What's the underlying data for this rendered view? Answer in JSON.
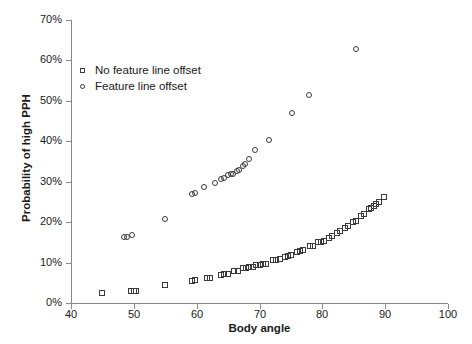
{
  "chart_data": {
    "type": "scatter",
    "title": "",
    "xlabel": "Body angle",
    "ylabel": "Probability of high PPH",
    "xlim": [
      40,
      100
    ],
    "ylim": [
      0,
      0.7
    ],
    "xticks": [
      "40",
      "50",
      "60",
      "70",
      "80",
      "90",
      "100"
    ],
    "xtick_values": [
      40,
      50,
      60,
      70,
      80,
      90,
      100
    ],
    "yticks": [
      "0%",
      "10%",
      "20%",
      "30%",
      "40%",
      "50%",
      "60%",
      "70%"
    ],
    "ytick_values": [
      0,
      10,
      20,
      30,
      40,
      50,
      60,
      70
    ],
    "grid": false,
    "legend_position": "upper-left-inside",
    "series": [
      {
        "name": "No feature line offset",
        "marker": "square",
        "color": "#3b3b3b",
        "points": [
          [
            45.0,
            2.5
          ],
          [
            49.6,
            3.0
          ],
          [
            50.0,
            3.0
          ],
          [
            50.4,
            3.0
          ],
          [
            55.0,
            4.5
          ],
          [
            59.2,
            5.5
          ],
          [
            59.8,
            5.6
          ],
          [
            61.6,
            6.2
          ],
          [
            62.2,
            6.3
          ],
          [
            63.8,
            7.0
          ],
          [
            64.4,
            7.1
          ],
          [
            65.0,
            7.2
          ],
          [
            66.0,
            7.8
          ],
          [
            66.6,
            7.9
          ],
          [
            67.4,
            8.6
          ],
          [
            67.9,
            8.7
          ],
          [
            68.4,
            8.8
          ],
          [
            68.9,
            8.9
          ],
          [
            69.5,
            9.4
          ],
          [
            70.0,
            9.5
          ],
          [
            70.5,
            9.6
          ],
          [
            71.0,
            9.7
          ],
          [
            72.2,
            10.6
          ],
          [
            72.7,
            10.7
          ],
          [
            73.2,
            10.8
          ],
          [
            74.0,
            11.4
          ],
          [
            74.5,
            11.6
          ],
          [
            75.0,
            11.8
          ],
          [
            76.0,
            12.6
          ],
          [
            76.5,
            12.8
          ],
          [
            77.0,
            13.0
          ],
          [
            78.0,
            14.0
          ],
          [
            78.5,
            14.2
          ],
          [
            79.3,
            15.0
          ],
          [
            79.8,
            15.2
          ],
          [
            80.3,
            15.4
          ],
          [
            81.0,
            16.2
          ],
          [
            81.5,
            16.5
          ],
          [
            82.3,
            17.4
          ],
          [
            82.8,
            17.7
          ],
          [
            83.6,
            18.6
          ],
          [
            84.1,
            19.0
          ],
          [
            84.9,
            20.0
          ],
          [
            85.4,
            20.4
          ],
          [
            86.2,
            21.6
          ],
          [
            86.7,
            22.0
          ],
          [
            87.4,
            23.2
          ],
          [
            87.8,
            23.6
          ],
          [
            88.2,
            24.0
          ],
          [
            88.6,
            24.6
          ],
          [
            89.0,
            25.0
          ],
          [
            89.8,
            26.2
          ]
        ]
      },
      {
        "name": "Feature line offset",
        "marker": "circle",
        "color": "#3b3b3b",
        "points": [
          [
            48.4,
            16.3
          ],
          [
            48.9,
            16.4
          ],
          [
            49.7,
            16.9
          ],
          [
            55.0,
            20.8
          ],
          [
            59.3,
            26.9
          ],
          [
            59.7,
            27.1
          ],
          [
            61.2,
            28.6
          ],
          [
            62.9,
            29.8
          ],
          [
            63.9,
            30.6
          ],
          [
            64.4,
            30.8
          ],
          [
            65.0,
            31.6
          ],
          [
            65.4,
            31.8
          ],
          [
            65.8,
            32.0
          ],
          [
            66.4,
            32.6
          ],
          [
            66.8,
            32.9
          ],
          [
            67.3,
            34.0
          ],
          [
            67.7,
            34.3
          ],
          [
            68.4,
            35.6
          ],
          [
            69.3,
            37.8
          ],
          [
            71.5,
            40.2
          ],
          [
            75.1,
            47.0
          ],
          [
            77.9,
            51.4
          ],
          [
            85.4,
            62.8
          ]
        ]
      }
    ]
  },
  "legend": {
    "items": [
      {
        "label": "No feature line offset",
        "marker": "square"
      },
      {
        "label": "Feature line offset",
        "marker": "circle"
      }
    ]
  }
}
